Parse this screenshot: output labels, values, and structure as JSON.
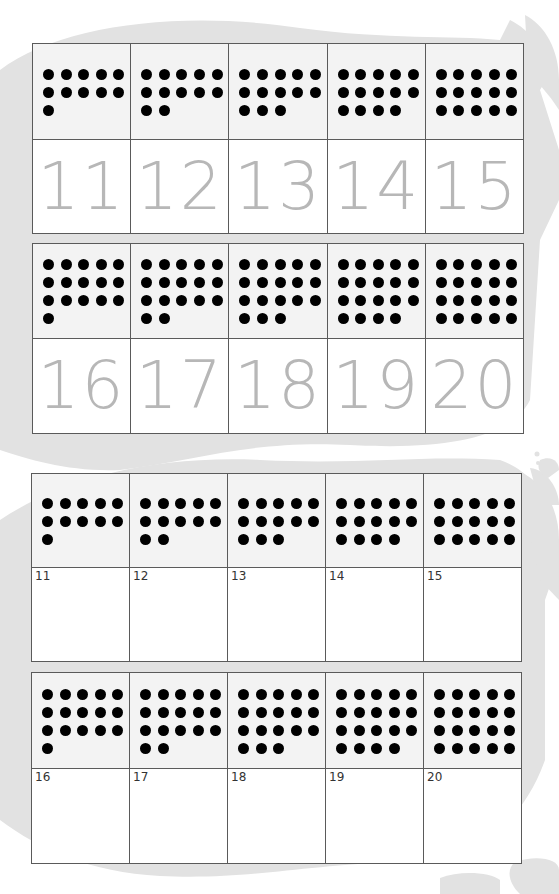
{
  "colors": {
    "background_blob": "#e2e2e2",
    "dot_cell_fill": "#f3f3f3",
    "number_cell_fill": "#ffffff",
    "traced_numeral": "#b7b7b7",
    "label_numeral": "#333333",
    "dot": "#000000",
    "grid_line": "#5a5a5a"
  },
  "pages": [
    {
      "name": "tracing-cards",
      "style": "traced",
      "grids": [
        {
          "x": 32,
          "y": 43,
          "cell_w": 98.2,
          "dot_h": 96,
          "num_h": 94,
          "cards": [
            {
              "number": "11",
              "count": 11
            },
            {
              "number": "12",
              "count": 12
            },
            {
              "number": "13",
              "count": 13
            },
            {
              "number": "14",
              "count": 14
            },
            {
              "number": "15",
              "count": 15
            }
          ]
        },
        {
          "x": 32,
          "y": 243,
          "cell_w": 98.2,
          "dot_h": 95,
          "num_h": 95,
          "cards": [
            {
              "number": "16",
              "count": 16
            },
            {
              "number": "17",
              "count": 17
            },
            {
              "number": "18",
              "count": 18
            },
            {
              "number": "19",
              "count": 19
            },
            {
              "number": "20",
              "count": 20
            }
          ]
        }
      ]
    },
    {
      "name": "labeled-cards",
      "style": "label",
      "grids": [
        {
          "x": 31,
          "y": 473,
          "cell_w": 98,
          "dot_h": 94,
          "num_h": 94,
          "cards": [
            {
              "number": "11",
              "count": 11
            },
            {
              "number": "12",
              "count": 12
            },
            {
              "number": "13",
              "count": 13
            },
            {
              "number": "14",
              "count": 14
            },
            {
              "number": "15",
              "count": 15
            }
          ]
        },
        {
          "x": 31,
          "y": 672,
          "cell_w": 98,
          "dot_h": 96,
          "num_h": 95,
          "cards": [
            {
              "number": "16",
              "count": 16
            },
            {
              "number": "17",
              "count": 17
            },
            {
              "number": "18",
              "count": 18
            },
            {
              "number": "19",
              "count": 19
            },
            {
              "number": "20",
              "count": 20
            }
          ]
        }
      ]
    }
  ]
}
